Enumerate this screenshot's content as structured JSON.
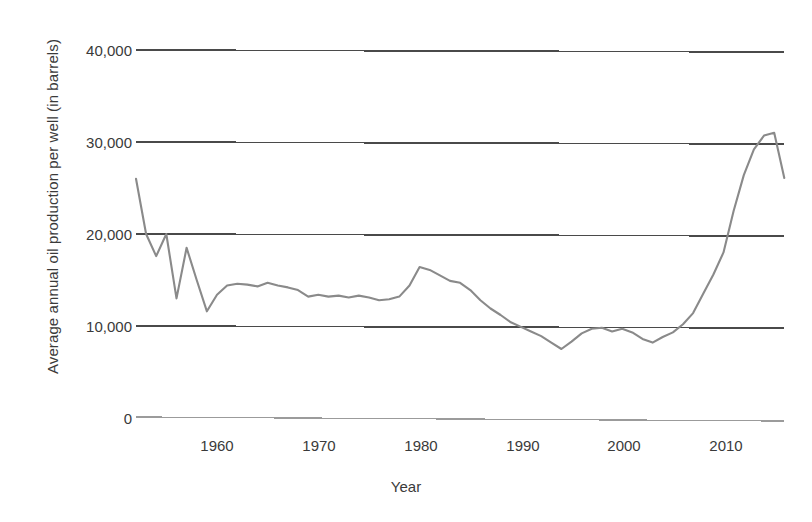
{
  "chart_data": {
    "type": "line",
    "title": "",
    "xlabel": "Year",
    "ylabel": "Average annual oil production per well (in barrels)",
    "xlim": [
      1952,
      2016
    ],
    "ylim": [
      0,
      40000
    ],
    "xticks": [
      1960,
      1970,
      1980,
      1990,
      2000,
      2010
    ],
    "xtick_labels": [
      "1960",
      "1970",
      "1980",
      "1990",
      "2000",
      "2010"
    ],
    "yticks": [
      0,
      10000,
      20000,
      30000,
      40000
    ],
    "ytick_labels": [
      "0",
      "10,000",
      "20,000",
      "30,000",
      "40,000"
    ],
    "grid": true,
    "grid_axis": "y",
    "legend": false,
    "line_color": "#8a8a8a",
    "series": [
      {
        "name": "Average annual oil production per well",
        "x": [
          1952,
          1953,
          1954,
          1955,
          1956,
          1957,
          1958,
          1959,
          1960,
          1961,
          1962,
          1963,
          1964,
          1965,
          1966,
          1967,
          1968,
          1969,
          1970,
          1971,
          1972,
          1973,
          1974,
          1975,
          1976,
          1977,
          1978,
          1979,
          1980,
          1981,
          1982,
          1983,
          1984,
          1985,
          1986,
          1987,
          1988,
          1989,
          1990,
          1991,
          1992,
          1993,
          1994,
          1995,
          1996,
          1997,
          1998,
          1999,
          2000,
          2001,
          2002,
          2003,
          2004,
          2005,
          2006,
          2007,
          2008,
          2009,
          2010,
          2011,
          2012,
          2013,
          2014,
          2015,
          2016
        ],
        "values": [
          26000,
          20000,
          17600,
          20000,
          13000,
          18500,
          15000,
          11600,
          13400,
          14400,
          14600,
          14500,
          14300,
          14700,
          14400,
          14200,
          13900,
          13200,
          13400,
          13200,
          13300,
          13100,
          13300,
          13100,
          12800,
          12900,
          13200,
          14400,
          16400,
          16100,
          15500,
          14900,
          14700,
          13900,
          12800,
          11900,
          11200,
          10400,
          9900,
          9400,
          8900,
          8200,
          7500,
          8300,
          9200,
          9700,
          9800,
          9400,
          9700,
          9300,
          8600,
          8200,
          8800,
          9300,
          10200,
          11400,
          13500,
          15600,
          18000,
          22500,
          26400,
          29200,
          30700,
          31000,
          26100
        ]
      }
    ]
  },
  "axis": {
    "y_title": "Average annual oil production per well (in barrels)",
    "x_title": "Year"
  }
}
